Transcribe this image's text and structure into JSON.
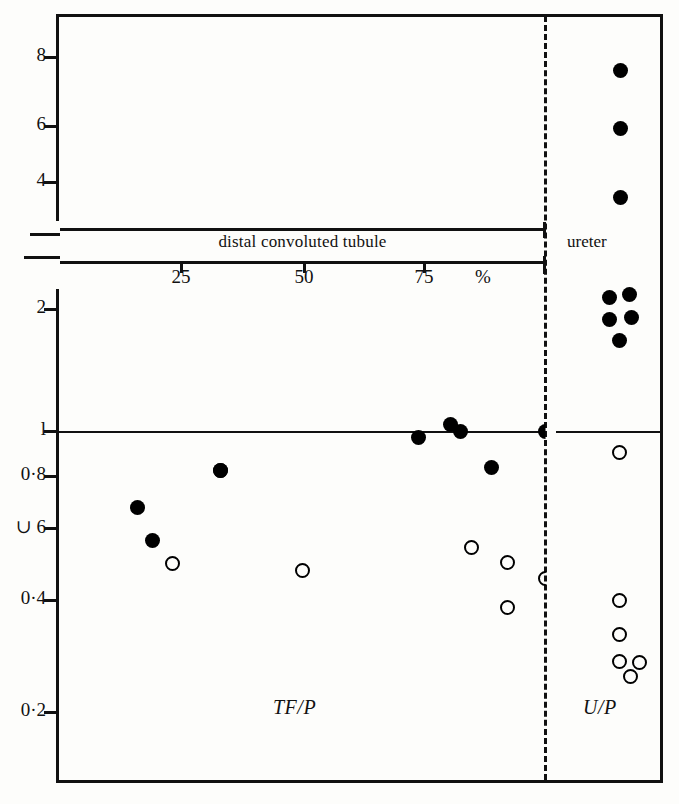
{
  "figure": {
    "band_label": "distal convoluted tubule",
    "ureter_label": "ureter",
    "tfp_caption": "TF/P",
    "up_caption": "U/P"
  },
  "axes": {
    "y_ticks": [
      {
        "label": "8",
        "y": 57
      },
      {
        "label": "6",
        "y": 126
      },
      {
        "label": "4",
        "y": 182
      },
      {
        "label": "2",
        "y": 309
      },
      {
        "label": "l",
        "y": 431
      },
      {
        "label": "0·8",
        "y": 476
      },
      {
        "label": "∪ 6",
        "y": 528
      },
      {
        "label": "0·4",
        "y": 600
      },
      {
        "label": "0·2",
        "y": 712
      }
    ],
    "x_ticks": [
      {
        "label": "25",
        "x": 180
      },
      {
        "label": "50",
        "x": 303
      },
      {
        "label": "75",
        "x": 423
      }
    ],
    "percent_label": "%",
    "percent_x": 483
  },
  "chart_data": {
    "type": "scatter",
    "title": "",
    "xlabel": "%",
    "ylabel": "",
    "ylim": [
      0.15,
      9
    ],
    "xlim": [
      0,
      100
    ],
    "y_scale": "log",
    "grid": false,
    "legend": null,
    "annotations": [
      "distal convoluted tubule",
      "ureter",
      "TF/P",
      "U/P"
    ],
    "series": [
      {
        "name": "TF/P filled",
        "marker": "filled-circle",
        "region": "distal convoluted tubule",
        "points": [
          {
            "x": 13,
            "y": 0.66,
            "px": 220,
            "py": 470
          },
          {
            "x": 7,
            "y": 0.56,
            "px": 137,
            "py": 507
          },
          {
            "x": 9,
            "y": 0.5,
            "px": 152,
            "py": 540
          },
          {
            "x": 32,
            "y": 0.82,
            "px": 220,
            "py": 470
          },
          {
            "x": 71,
            "y": 0.97,
            "px": 418,
            "py": 437
          },
          {
            "x": 80,
            "y": 1.03,
            "px": 450,
            "py": 424
          },
          {
            "x": 82,
            "y": 1.0,
            "px": 460,
            "py": 431
          },
          {
            "x": 88,
            "y": 0.83,
            "px": 491,
            "py": 467
          },
          {
            "x": 100,
            "y": 1.0,
            "px": 545,
            "py": 431
          }
        ]
      },
      {
        "name": "TF/P open",
        "marker": "open-circle",
        "region": "distal convoluted tubule",
        "points": [
          {
            "x": 15,
            "y": 0.5,
            "px": 172,
            "py": 563
          },
          {
            "x": 48,
            "y": 0.48,
            "px": 302,
            "py": 570
          },
          {
            "x": 85,
            "y": 0.54,
            "px": 471,
            "py": 547
          },
          {
            "x": 92,
            "y": 0.51,
            "px": 507,
            "py": 562
          },
          {
            "x": 92,
            "y": 0.39,
            "px": 507,
            "py": 607
          },
          {
            "x": 100,
            "y": 0.45,
            "px": 545,
            "py": 578
          }
        ]
      },
      {
        "name": "U/P filled",
        "marker": "filled-circle",
        "region": "ureter",
        "points": [
          {
            "y": 7.6,
            "px": 620,
            "py": 70
          },
          {
            "y": 5.4,
            "px": 620,
            "py": 128
          },
          {
            "y": 3.5,
            "px": 620,
            "py": 197
          },
          {
            "y": 2.1,
            "px": 609,
            "py": 297
          },
          {
            "y": 2.1,
            "px": 629,
            "py": 294
          },
          {
            "y": 1.9,
            "px": 609,
            "py": 319
          },
          {
            "y": 1.9,
            "px": 631,
            "py": 317
          },
          {
            "y": 1.7,
            "px": 619,
            "py": 340
          }
        ]
      },
      {
        "name": "U/P open",
        "marker": "open-circle",
        "region": "ureter",
        "points": [
          {
            "y": 0.87,
            "px": 619,
            "py": 452
          },
          {
            "y": 0.41,
            "px": 619,
            "py": 600
          },
          {
            "y": 0.34,
            "px": 619,
            "py": 634
          },
          {
            "y": 0.3,
            "px": 619,
            "py": 661
          },
          {
            "y": 0.3,
            "px": 639,
            "py": 662
          },
          {
            "y": 0.28,
            "px": 630,
            "py": 676
          }
        ]
      }
    ]
  }
}
